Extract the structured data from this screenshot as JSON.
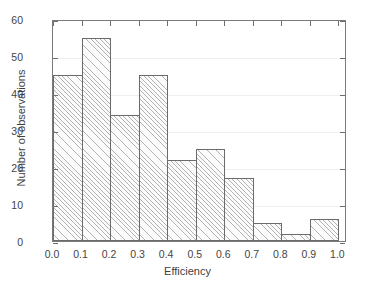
{
  "chart_data": {
    "type": "bar",
    "title": "",
    "xlabel": "Efficiency",
    "ylabel": "Number of observations",
    "bin_width": 0.1,
    "bin_edges": [
      0.0,
      0.1,
      0.2,
      0.3,
      0.4,
      0.5,
      0.6,
      0.7,
      0.8,
      0.9,
      1.0
    ],
    "categories": [
      "0.0-0.1",
      "0.1-0.2",
      "0.2-0.3",
      "0.3-0.4",
      "0.4-0.5",
      "0.5-0.6",
      "0.6-0.7",
      "0.7-0.8",
      "0.8-0.9",
      "0.9-1.0"
    ],
    "values": [
      45,
      55,
      34,
      45,
      22,
      25,
      17,
      5,
      2,
      6
    ],
    "xlim": [
      0.0,
      1.03
    ],
    "ylim": [
      0,
      60
    ],
    "xticks": [
      0.0,
      0.1,
      0.2,
      0.3,
      0.4,
      0.5,
      0.6,
      0.7,
      0.8,
      0.9,
      1.0
    ],
    "xtick_labels": [
      "0.0",
      "0.1",
      "0.2",
      "0.3",
      "0.4",
      "0.5",
      "0.6",
      "0.7",
      "0.8",
      "0.9",
      "1.0"
    ],
    "yticks": [
      0,
      10,
      20,
      30,
      40,
      50,
      60
    ],
    "ytick_labels": [
      "0",
      "10",
      "20",
      "30",
      "40",
      "50",
      "60"
    ],
    "grid": "horizontal",
    "legend": "none",
    "colors": {
      "bar_edge": "#6b6b6b",
      "bar_face": "#fbfbfb",
      "hatch": "#787878",
      "gridline": "#f0efef",
      "frame": "#7a7a7a",
      "text": "#3f3f3f",
      "background": "#ffffff"
    }
  }
}
